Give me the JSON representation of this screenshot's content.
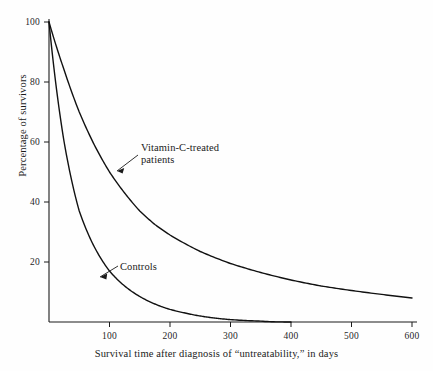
{
  "figure": {
    "background_color": "#fefefe",
    "line_color": "#111111",
    "axis_color": "#1a1a1a"
  },
  "axes": {
    "x_title": "Survival time after diagnosis of “untreatability,” in days",
    "y_title": "Percentage of survivors",
    "x_ticks": [
      "100",
      "200",
      "300",
      "400",
      "500",
      "600"
    ],
    "y_ticks": [
      "20",
      "40",
      "60",
      "80",
      "100"
    ]
  },
  "annotations": {
    "vitamin_c": "Vitamin-C-treated\npatients",
    "controls": "Controls"
  },
  "chart_data": {
    "type": "line",
    "title": "",
    "subtitle": "",
    "xlabel": "Survival time after diagnosis of “untreatability,” in days",
    "ylabel": "Percentage of survivors",
    "xlim": [
      0,
      600
    ],
    "ylim": [
      0,
      100
    ],
    "x_ticks": [
      100,
      200,
      300,
      400,
      500,
      600
    ],
    "y_ticks": [
      20,
      40,
      60,
      80,
      100
    ],
    "grid": false,
    "legend": "none",
    "annotations": [
      {
        "text": "Vitamin-C-treated patients",
        "series": "Vitamin-C-treated patients",
        "label_x": 152,
        "label_y": 60,
        "points_to_x": 104,
        "points_to_y": 48
      },
      {
        "text": "Controls",
        "series": "Controls",
        "label_x": 118,
        "label_y": 20,
        "points_to_x": 83,
        "points_to_y": 14
      }
    ],
    "series": [
      {
        "name": "Vitamin-C-treated patients",
        "x": [
          0,
          25,
          50,
          75,
          100,
          125,
          150,
          175,
          200,
          250,
          300,
          350,
          400,
          450,
          500,
          550,
          600
        ],
        "values": [
          100,
          84,
          70,
          59,
          50,
          43,
          37,
          32.5,
          29,
          23.5,
          19.5,
          16.5,
          14,
          12,
          10.5,
          9.2,
          8
        ]
      },
      {
        "name": "Controls",
        "x": [
          0,
          25,
          50,
          75,
          100,
          125,
          150,
          175,
          200,
          225,
          250,
          275,
          300,
          350,
          400
        ],
        "values": [
          100,
          60,
          37,
          25,
          17,
          12,
          8.5,
          6,
          4.2,
          3,
          2,
          1.3,
          0.8,
          0.3,
          0
        ]
      }
    ]
  }
}
